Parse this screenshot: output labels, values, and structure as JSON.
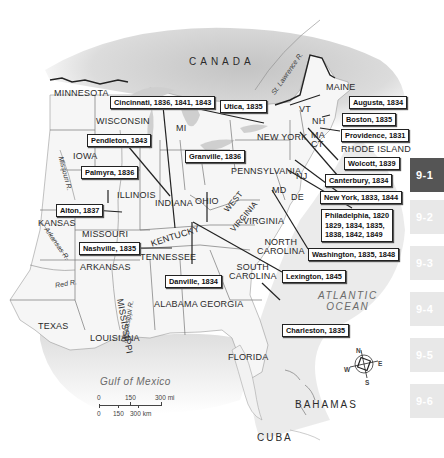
{
  "map": {
    "title_regions": {
      "canada": "CANADA",
      "atlantic": "ATLANTIC",
      "ocean": "OCEAN",
      "gulf": "Gulf of Mexico",
      "bahamas": "BAHAMAS",
      "cuba": "CUBA"
    },
    "states": {
      "minnesota": "MINNESOTA",
      "wisconsin": "WISCONSIN",
      "mi": "MI",
      "iowa": "IOWA",
      "illinois": "ILLINOIS",
      "indiana": "INDIANA",
      "ohio": "OHIO",
      "kansas": "KANSAS",
      "missouri": "MISSOURI",
      "kentucky": "KENTUCKY",
      "west_virginia_1": "WEST",
      "west_virginia_2": "VIRGINIA",
      "virginia": "VIRGINIA",
      "pennsylvania": "PENNSYLVANIA",
      "new_york": "NEW YORK",
      "maine": "MAINE",
      "vt": "VT",
      "nh": "NH",
      "ma": "MA",
      "ct": "CT",
      "rhode_island": "RHODE ISLAND",
      "nj": "NJ",
      "md": "MD",
      "de": "DE",
      "north_carolina_1": "NORTH",
      "north_carolina_2": "CAROLINA",
      "south_carolina_1": "SOUTH",
      "south_carolina_2": "CAROLINA",
      "tennessee": "TENNESSEE",
      "arkansas": "ARKANSAS",
      "mississippi": "MISSISSIPPI",
      "alabama": "ALABAMA",
      "georgia": "GEORGIA",
      "texas": "TEXAS",
      "louisiana": "LOUISIANA",
      "florida": "FLORIDA"
    },
    "rivers": {
      "st_lawrence": "St. Lawrence R.",
      "missouri": "Missouri R.",
      "arkansas": "Arkansas R.",
      "red": "Red R.",
      "mississippi": "Mississippi R."
    },
    "callouts": [
      {
        "id": "cincinnati",
        "text": "Cincinnati, 1836, 1841, 1843"
      },
      {
        "id": "utica",
        "text": "Utica, 1835"
      },
      {
        "id": "augusta",
        "text": "Augusta, 1834"
      },
      {
        "id": "boston",
        "text": "Boston, 1835"
      },
      {
        "id": "providence",
        "text": "Providence, 1831"
      },
      {
        "id": "wolcott",
        "text": "Wolcott, 1839"
      },
      {
        "id": "canterbury",
        "text": "Canterbury, 1834"
      },
      {
        "id": "newyork",
        "text": "New York, 1833, 1844"
      },
      {
        "id": "philadelphia",
        "lines": [
          "Philadelphia, 1820",
          "1829, 1834, 1835,",
          "1838, 1842, 1849"
        ]
      },
      {
        "id": "washington",
        "text": "Washington, 1835, 1848"
      },
      {
        "id": "lexington",
        "text": "Lexington, 1845"
      },
      {
        "id": "charleston",
        "text": "Charleston, 1835"
      },
      {
        "id": "pendleton",
        "text": "Pendleton, 1843"
      },
      {
        "id": "granville",
        "text": "Granville, 1836"
      },
      {
        "id": "palmyra",
        "text": "Palmyra, 1836"
      },
      {
        "id": "alton",
        "text": "Alton, 1837"
      },
      {
        "id": "nashville",
        "text": "Nashville, 1835"
      },
      {
        "id": "danville",
        "text": "Danville, 1834"
      }
    ],
    "scale": {
      "mi_0": "0",
      "mi_150": "150",
      "mi_300": "300 mi",
      "km_0": "0",
      "km_150": "150",
      "km_300": "300 km"
    },
    "compass": {
      "n": "N",
      "e": "E",
      "s": "S",
      "w": "W"
    }
  },
  "tabs": [
    {
      "label": "9-1",
      "active": true
    },
    {
      "label": "9-2",
      "active": false
    },
    {
      "label": "9-3",
      "active": false
    },
    {
      "label": "9-4",
      "active": false
    },
    {
      "label": "9-5",
      "active": false
    },
    {
      "label": "9-6",
      "active": false
    }
  ],
  "colors": {
    "land": "#f4f4f4",
    "canada": "#c9c9c9",
    "water": "#d8d8d8",
    "active_tab": "#555555",
    "inactive_tab": "#e8e8e8"
  }
}
